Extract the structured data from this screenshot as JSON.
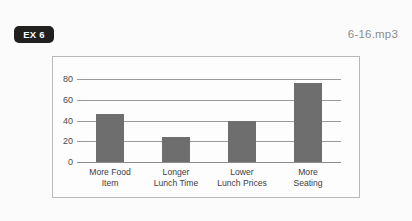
{
  "header": {
    "badge_label": "EX 6",
    "audio_filename": "6-16.mp3"
  },
  "colors": {
    "badge_background": "#221f1f",
    "badge_text": "#ffffff",
    "bar_fill": "#6e6e6e",
    "panel_border": "#b9b9b9",
    "gridline": "#9a9a9a",
    "page_background": "#fbfbfb",
    "filename_text": "#8d8d8d"
  },
  "chart_data": {
    "type": "bar",
    "title": "",
    "xlabel": "",
    "ylabel": "",
    "categories": [
      "More Food Item",
      "Longer Lunch Time",
      "Lower Lunch Prices",
      "More Seating"
    ],
    "category_lines": [
      [
        "More Food",
        "Item"
      ],
      [
        "Longer",
        "Lunch Time"
      ],
      [
        "Lower",
        "Lunch Prices"
      ],
      [
        "More",
        "Seating"
      ]
    ],
    "values": [
      46,
      24,
      40,
      76
    ],
    "ylim": [
      0,
      80
    ],
    "yticks": [
      0,
      20,
      40,
      60,
      80
    ],
    "grid": true,
    "legend": "none"
  }
}
